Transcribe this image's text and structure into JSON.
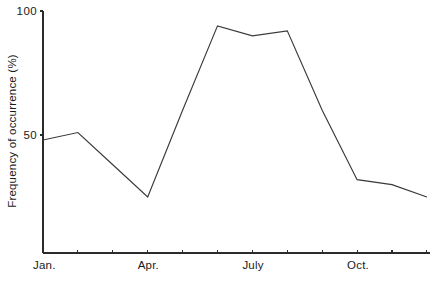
{
  "chart_data": {
    "type": "line",
    "title": "",
    "subtitle": "",
    "xlabel": "",
    "ylabel": "Frequency of occurrence (%)",
    "categories": [
      "Jan.",
      "Feb.",
      "Mar.",
      "Apr.",
      "May",
      "June",
      "July",
      "Aug.",
      "Sept.",
      "Oct.",
      "Nov.",
      "Dec."
    ],
    "values": [
      48,
      51,
      38,
      25,
      60,
      94,
      90,
      92,
      60,
      32,
      30,
      25
    ],
    "series": [
      {
        "name": "Frequency of occurrence",
        "values": [
          48,
          51,
          38,
          25,
          60,
          94,
          90,
          92,
          60,
          32,
          30,
          25
        ]
      }
    ],
    "ylim": [
      0,
      100
    ],
    "y_ticks": [
      50,
      100
    ],
    "y_tick_labels": [
      "50",
      "100"
    ],
    "x_tick_labels": [
      "Jan.",
      "Apr.",
      "July",
      "Oct."
    ],
    "x_tick_label_indices": [
      0,
      3,
      6,
      9
    ],
    "x_tick_count": 12,
    "grid": false,
    "legend": "none",
    "line_color": "#3a3a3a",
    "axis_color": "#2b2b2b",
    "background_color": "#ffffff"
  },
  "geometry": {
    "plot_left": 43,
    "plot_right": 430,
    "axis_bottom": 253,
    "axis_top": 11,
    "y100_px": 11,
    "y50_px": 135,
    "x_step": 34.9,
    "tick_length": 3
  },
  "labels": {
    "y_axis_title": "Frequency of occurrence (%)",
    "y_top": "100",
    "y_mid": "50",
    "x_jan": "Jan.",
    "x_apr": "Apr.",
    "x_july": "July",
    "x_oct": "Oct."
  }
}
